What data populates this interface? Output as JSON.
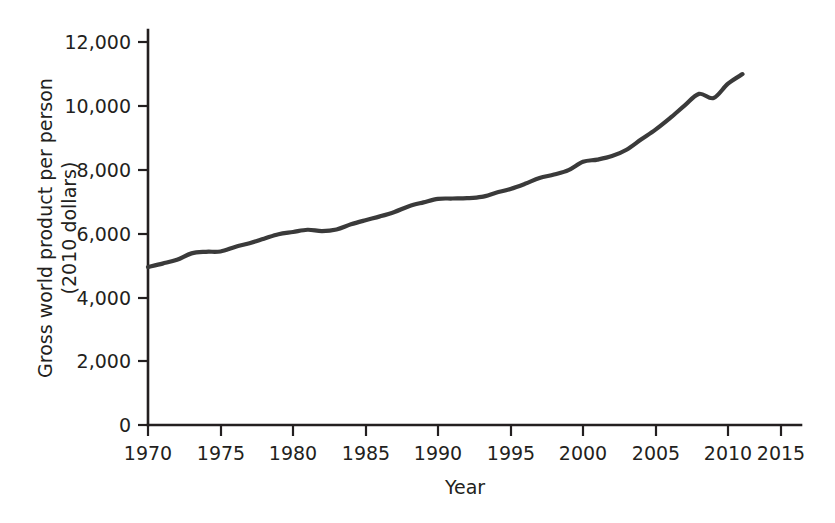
{
  "chart_data": {
    "type": "line",
    "title": "",
    "subtitle": "",
    "xlabel": "Year",
    "ylabel": "Gross world product per person (2010 dollars)",
    "ylabel_line1": "Gross world product per person",
    "ylabel_line2": "(2010 dollars)",
    "xlim": [
      1970,
      2016.5
    ],
    "ylim": [
      0,
      12600
    ],
    "grid": false,
    "legend": "none",
    "xticks": [
      1970,
      1975,
      1980,
      1985,
      1990,
      1995,
      2000,
      2005,
      2010,
      2015
    ],
    "xtick_labels": [
      "1970",
      "1975",
      "1980",
      "1985",
      "1990",
      "1995",
      "2000",
      "2005",
      "2010",
      "2015"
    ],
    "yticks": [
      0,
      2000,
      4000,
      6000,
      8000,
      10000,
      12000
    ],
    "ytick_labels": [
      "0",
      "2,000",
      "4,000",
      "6,000",
      "8,000",
      "10,000",
      "12,000"
    ],
    "line_color": "#3a3a3a",
    "axis_color": "#231f20",
    "series": [
      {
        "name": "Gross world product per person",
        "x": [
          1970,
          1971,
          1972,
          1973,
          1974,
          1975,
          1976,
          1977,
          1978,
          1979,
          1980,
          1981,
          1982,
          1983,
          1984,
          1985,
          1986,
          1987,
          1988,
          1989,
          1990,
          1991,
          1992,
          1993,
          1994,
          1995,
          1996,
          1997,
          1998,
          1999,
          2000,
          2001,
          2002,
          2003,
          2004,
          2005,
          2006,
          2007,
          2008,
          2009,
          2010,
          2011
        ],
        "values": [
          4950,
          5060,
          5180,
          5380,
          5430,
          5440,
          5580,
          5700,
          5840,
          5980,
          6050,
          6120,
          6080,
          6130,
          6290,
          6420,
          6540,
          6680,
          6860,
          6980,
          7090,
          7100,
          7110,
          7150,
          7280,
          7400,
          7560,
          7740,
          7850,
          7990,
          8250,
          8320,
          8430,
          8630,
          8950,
          9260,
          9620,
          10010,
          10380,
          10250,
          10700,
          11000
        ]
      }
    ]
  },
  "axis_geometry": {
    "x_origin_px": 148,
    "y_origin_px": 425,
    "px_per_year": 14.5,
    "px_per_1000": 31.9,
    "x_axis_end_px": 800,
    "y_axis_top_px": 30
  }
}
